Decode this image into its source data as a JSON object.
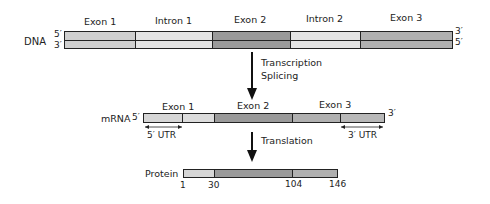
{
  "colors": {
    "exon1": "#cfcfcf",
    "intron": "#e4e4e4",
    "exon2": "#9a9a9a",
    "exon3": "#b0b0b0",
    "utr": "#d6d6d6",
    "outline": "#222222"
  },
  "dna": {
    "label": "DNA",
    "top_end_left": "5′",
    "bottom_end_left": "3′",
    "top_end_right": "3′",
    "bottom_end_right": "5′",
    "segments": [
      {
        "label": "Exon 1",
        "type": "exon1"
      },
      {
        "label": "Intron 1",
        "type": "intron"
      },
      {
        "label": "Exon 2",
        "type": "exon2"
      },
      {
        "label": "Intron 2",
        "type": "intron"
      },
      {
        "label": "Exon 3",
        "type": "exon3"
      }
    ]
  },
  "step1": {
    "line1": "Transcription",
    "line2": "Splicing"
  },
  "mrna": {
    "label": "mRNA",
    "left_end": "5′",
    "right_end": "3′",
    "segments": [
      {
        "label": "Exon 1"
      },
      {
        "label": "Exon 2"
      },
      {
        "label": "Exon 3"
      }
    ],
    "utr5": "5′ UTR",
    "utr3": "3′ UTR"
  },
  "step2": {
    "label": "Translation"
  },
  "protein": {
    "label": "Protein",
    "positions": [
      "1",
      "30",
      "104",
      "146"
    ]
  }
}
